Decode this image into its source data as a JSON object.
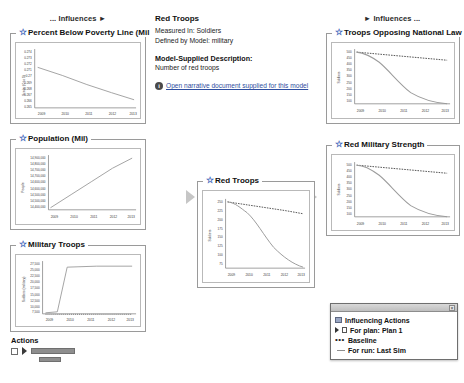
{
  "columns": {
    "left_header": "... Influences ►",
    "right_header": "► Influences ..."
  },
  "info": {
    "title": "Red Troops",
    "measured_in": "Measured In: Soldiers",
    "defined_by": "Defined by Model: military",
    "description_heading": "Model-Supplied Description:",
    "description_text": "Number of red troops",
    "link_text": "Open narrative document supplied for this model",
    "info_icon": "info-icon"
  },
  "actions": {
    "title": "Actions",
    "checkbox": "action-checkbox",
    "play": "play-icon"
  },
  "legend": {
    "title": "",
    "close": "×",
    "items": [
      {
        "label": "Influencing Actions",
        "glyph": "flag-icon"
      },
      {
        "label": "For plan: Plan 1",
        "glyph": "plan-icon"
      },
      {
        "label": "Baseline",
        "glyph": "dotted-line-icon"
      },
      {
        "label": "For run: Last Sim",
        "glyph": "solid-line-icon"
      }
    ]
  },
  "charts": [
    {
      "id": "poverty",
      "title": "Percent Below Poverty Line (Mil",
      "type": "line",
      "ylabel": "Scalar (0 to 1)",
      "xlabel": "",
      "x": [
        2009,
        2010,
        2011,
        2012,
        2013
      ],
      "yticks": [
        0.274,
        0.273,
        0.272,
        0.271,
        0.27,
        0.269,
        0.268,
        0.267,
        0.266,
        0.265
      ],
      "xticks": [
        "2009",
        "2010",
        "2011",
        "2012",
        "2013"
      ],
      "ylim": [
        0.265,
        0.2745
      ],
      "series": [
        {
          "name": "For run: Last Sim",
          "style": "solid",
          "values": [
            0.2718,
            0.2704,
            0.269,
            0.2676,
            0.2665
          ]
        }
      ]
    },
    {
      "id": "population",
      "title": "Population (Mil)",
      "type": "line",
      "ylabel": "People",
      "xlabel": "",
      "x": [
        2009,
        2010,
        2011,
        2012,
        2013
      ],
      "yticks": [
        "14,900,000",
        "14,800,000",
        "14,700,000",
        "14,700,000",
        "14,600,000",
        "14,600,000",
        "14,500,000",
        "14,500,000",
        "14,400,000"
      ],
      "xticks": [
        "2009",
        "2010",
        "2011",
        "2012",
        "2013"
      ],
      "ylim": [
        14400000,
        14950000
      ],
      "series": [
        {
          "name": "For run: Last Sim",
          "style": "solid",
          "values": [
            14420000,
            14560000,
            14690000,
            14820000,
            14930000
          ]
        }
      ]
    },
    {
      "id": "military_troops",
      "title": "Military Troops",
      "type": "line",
      "ylabel": "Soldiers (military)",
      "xlabel": "",
      "x": [
        2009,
        2010,
        2011,
        2012,
        2013
      ],
      "yticks": [
        "27,500",
        "25,000",
        "22,500",
        "20,000",
        "17,500",
        "15,000",
        "12,500",
        "10,000",
        "7,500"
      ],
      "xticks": [
        "2009",
        "2010",
        "2011",
        "2012",
        "2013"
      ],
      "ylim": [
        7500,
        28000
      ],
      "series": [
        {
          "name": "For run: Last Sim",
          "style": "solid",
          "values": [
            8000,
            8000,
            27000,
            27000,
            27000
          ]
        }
      ]
    },
    {
      "id": "red_troops",
      "title": "Red Troops",
      "type": "line",
      "ylabel": "Soldiers",
      "xlabel": "",
      "x": [
        2009,
        2010,
        2011,
        2012,
        2013
      ],
      "yticks": [
        250,
        225,
        200,
        175,
        150,
        125,
        100,
        75
      ],
      "xticks": [
        "2009",
        "2010",
        "2011",
        "2012",
        "2013"
      ],
      "ylim": [
        70,
        255
      ],
      "series": [
        {
          "name": "Baseline",
          "style": "dashed",
          "values": [
            250,
            243,
            235,
            228,
            221
          ]
        },
        {
          "name": "For run: Last Sim",
          "style": "solid",
          "values": [
            250,
            228,
            170,
            120,
            78
          ]
        }
      ]
    },
    {
      "id": "opposing_law",
      "title": "Troops Opposing National Law",
      "type": "line",
      "ylabel": "Soldiers",
      "xlabel": "",
      "x": [
        2009,
        2010,
        2011,
        2012,
        2013
      ],
      "yticks": [
        500,
        450,
        400,
        350,
        300,
        250,
        200,
        150,
        100
      ],
      "xticks": [
        "2009",
        "2010",
        "2011",
        "2012",
        "2013"
      ],
      "ylim": [
        80,
        520
      ],
      "series": [
        {
          "name": "Baseline",
          "style": "dashed",
          "values": [
            500,
            487,
            470,
            452,
            437
          ]
        },
        {
          "name": "For run: Last Sim",
          "style": "solid",
          "values": [
            500,
            455,
            340,
            215,
            120
          ]
        }
      ]
    },
    {
      "id": "red_military_strength",
      "title": "Red Military Strength",
      "type": "line",
      "ylabel": "Soldiers",
      "xlabel": "",
      "x": [
        2009,
        2010,
        2011,
        2012,
        2013
      ],
      "yticks": [
        500,
        450,
        400,
        350,
        300,
        250,
        200,
        150,
        100
      ],
      "xticks": [
        "2009",
        "2010",
        "2011",
        "2012",
        "2013"
      ],
      "ylim": [
        80,
        520
      ],
      "series": [
        {
          "name": "Baseline",
          "style": "dashed",
          "values": [
            500,
            489,
            474,
            458,
            444
          ]
        },
        {
          "name": "For run: Last Sim",
          "style": "solid",
          "values": [
            500,
            452,
            330,
            205,
            112
          ]
        }
      ]
    }
  ],
  "colors": {
    "star": "#3a63b8",
    "link": "#2f4fa0",
    "series_solid": "#9b9b9b",
    "series_dash": "#2b2b2b",
    "arrow": "#c6c6c6"
  }
}
